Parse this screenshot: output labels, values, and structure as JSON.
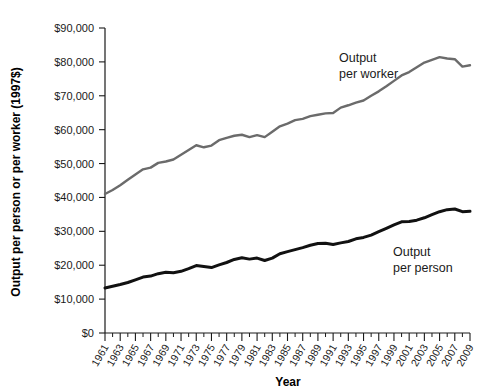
{
  "chart_data": {
    "type": "line",
    "title": "",
    "xlabel": "Year",
    "ylabel": "Output per person or per worker (1997$)",
    "ylim": [
      0,
      90000
    ],
    "xlim": [
      1961,
      2009
    ],
    "grid": false,
    "legend_position": "inline-annotation",
    "ytick_labels": [
      "$0",
      "$10,000",
      "$20,000",
      "$30,000",
      "$40,000",
      "$50,000",
      "$60,000",
      "$70,000",
      "$80,000",
      "$90,000"
    ],
    "ytick_values": [
      0,
      10000,
      20000,
      30000,
      40000,
      50000,
      60000,
      70000,
      80000,
      90000
    ],
    "xtick_labels": [
      "1961",
      "1963",
      "1965",
      "1967",
      "1969",
      "1971",
      "1973",
      "1975",
      "1977",
      "1979",
      "1981",
      "1983",
      "1985",
      "1987",
      "1989",
      "1991",
      "1993",
      "1995",
      "1997",
      "1999",
      "2001",
      "2003",
      "2005",
      "2007",
      "2009"
    ],
    "x": [
      1961,
      1962,
      1963,
      1964,
      1965,
      1966,
      1967,
      1968,
      1969,
      1970,
      1971,
      1972,
      1973,
      1974,
      1975,
      1976,
      1977,
      1978,
      1979,
      1980,
      1981,
      1982,
      1983,
      1984,
      1985,
      1986,
      1987,
      1988,
      1989,
      1990,
      1991,
      1992,
      1993,
      1994,
      1995,
      1996,
      1997,
      1998,
      1999,
      2000,
      2001,
      2002,
      2003,
      2004,
      2005,
      2006,
      2007,
      2008,
      2009
    ],
    "series": [
      {
        "name": "Output per worker",
        "color": "#6b6b6b",
        "annotation": "Output\nper worker",
        "values": [
          41000,
          42200,
          43600,
          45200,
          46800,
          48300,
          48800,
          50200,
          50600,
          51200,
          52600,
          54000,
          55400,
          54800,
          55300,
          56900,
          57600,
          58200,
          58500,
          57800,
          58400,
          57800,
          59400,
          61000,
          61800,
          62800,
          63200,
          64000,
          64400,
          64800,
          64900,
          66500,
          67200,
          68000,
          68600,
          70000,
          71300,
          72800,
          74400,
          76000,
          77000,
          78400,
          79800,
          80600,
          81400,
          81000,
          80800,
          78600,
          79000
        ]
      },
      {
        "name": "Output per person",
        "color": "#111111",
        "annotation": "Output\nper person",
        "values": [
          13300,
          13800,
          14300,
          14900,
          15700,
          16500,
          16800,
          17500,
          17900,
          17800,
          18200,
          19000,
          19900,
          19600,
          19300,
          20100,
          20800,
          21700,
          22200,
          21800,
          22100,
          21400,
          22100,
          23400,
          24000,
          24600,
          25200,
          25900,
          26400,
          26500,
          26100,
          26600,
          27000,
          27800,
          28200,
          28900,
          29900,
          30900,
          31900,
          32800,
          32900,
          33300,
          34000,
          34900,
          35800,
          36400,
          36600,
          35800,
          35900
        ]
      }
    ],
    "annotations": [
      {
        "id": "worker-label",
        "line1": "Output",
        "line2": "per worker"
      },
      {
        "id": "person-label",
        "line1": "Output",
        "line2": "per person"
      }
    ]
  }
}
